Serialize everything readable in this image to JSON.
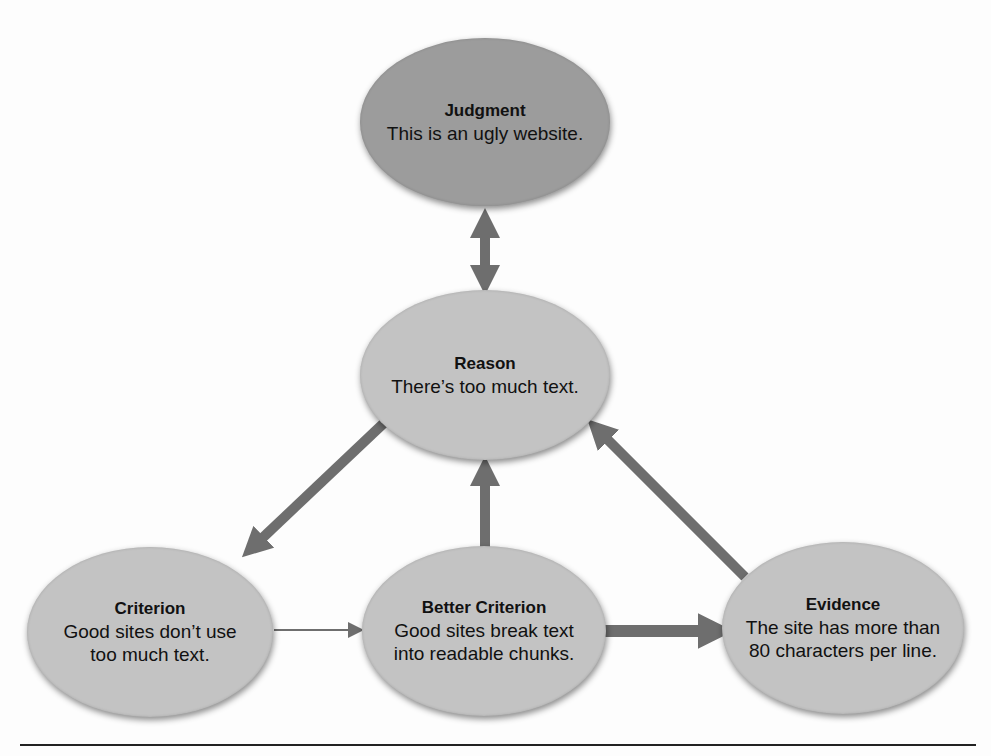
{
  "diagram": {
    "nodes": {
      "judgment": {
        "title": "Judgment",
        "text": "This is an ugly website.",
        "fill": "#9c9c9c"
      },
      "reason": {
        "title": "Reason",
        "text": "There’s too much text.",
        "fill": "#c3c3c3"
      },
      "criterion": {
        "title": "Criterion",
        "text_line1": "Good sites don’t use",
        "text_line2": "too much text.",
        "fill": "#c3c3c3"
      },
      "better_criterion": {
        "title": "Better Criterion",
        "text_line1": "Good sites break text",
        "text_line2": "into readable chunks.",
        "fill": "#c3c3c3"
      },
      "evidence": {
        "title": "Evidence",
        "text_line1": "The site has more than",
        "text_line2": "80 characters per line.",
        "fill": "#c3c3c3"
      }
    },
    "edges": [
      {
        "from": "judgment",
        "to": "reason",
        "style": "thick",
        "bidirectional": true
      },
      {
        "from": "reason",
        "to": "criterion",
        "style": "thick"
      },
      {
        "from": "criterion",
        "to": "better_criterion",
        "style": "thin"
      },
      {
        "from": "better_criterion",
        "to": "reason",
        "style": "thick"
      },
      {
        "from": "better_criterion",
        "to": "evidence",
        "style": "thick"
      },
      {
        "from": "evidence",
        "to": "reason",
        "style": "thick"
      }
    ],
    "colors": {
      "arrow": "#6e6e6e",
      "rule": "#222222"
    }
  }
}
